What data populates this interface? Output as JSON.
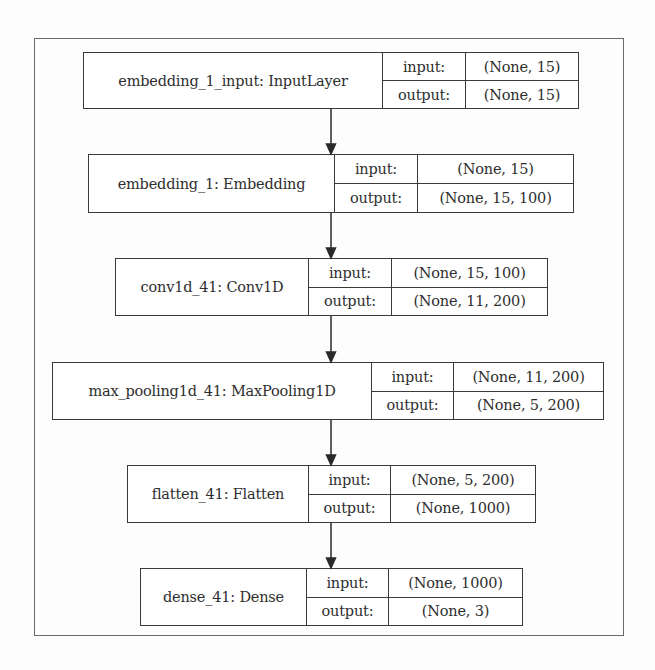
{
  "diagram": {
    "type": "keras-model-plot",
    "nodes": [
      {
        "name": "embedding_1_input: InputLayer",
        "input_label": "input:",
        "input": "(None, 15)",
        "output_label": "output:",
        "output": "(None, 15)"
      },
      {
        "name": "embedding_1: Embedding",
        "input_label": "input:",
        "input": "(None, 15)",
        "output_label": "output:",
        "output": "(None, 15, 100)"
      },
      {
        "name": "conv1d_41: Conv1D",
        "input_label": "input:",
        "input": "(None, 15, 100)",
        "output_label": "output:",
        "output": "(None, 11, 200)"
      },
      {
        "name": "max_pooling1d_41: MaxPooling1D",
        "input_label": "input:",
        "input": "(None, 11, 200)",
        "output_label": "output:",
        "output": "(None, 5, 200)"
      },
      {
        "name": "flatten_41: Flatten",
        "input_label": "input:",
        "input": "(None, 5, 200)",
        "output_label": "output:",
        "output": "(None, 1000)"
      },
      {
        "name": "dense_41: Dense",
        "input_label": "input:",
        "input": "(None, 1000)",
        "output_label": "output:",
        "output": "(None, 3)"
      }
    ],
    "edges": [
      {
        "from": 0,
        "to": 1
      },
      {
        "from": 1,
        "to": 2
      },
      {
        "from": 2,
        "to": 3
      },
      {
        "from": 3,
        "to": 4
      },
      {
        "from": 4,
        "to": 5
      }
    ],
    "colors": {
      "line": "#3a3a3a",
      "text": "#2e2e2e",
      "frame": "#6a6a6a"
    }
  }
}
